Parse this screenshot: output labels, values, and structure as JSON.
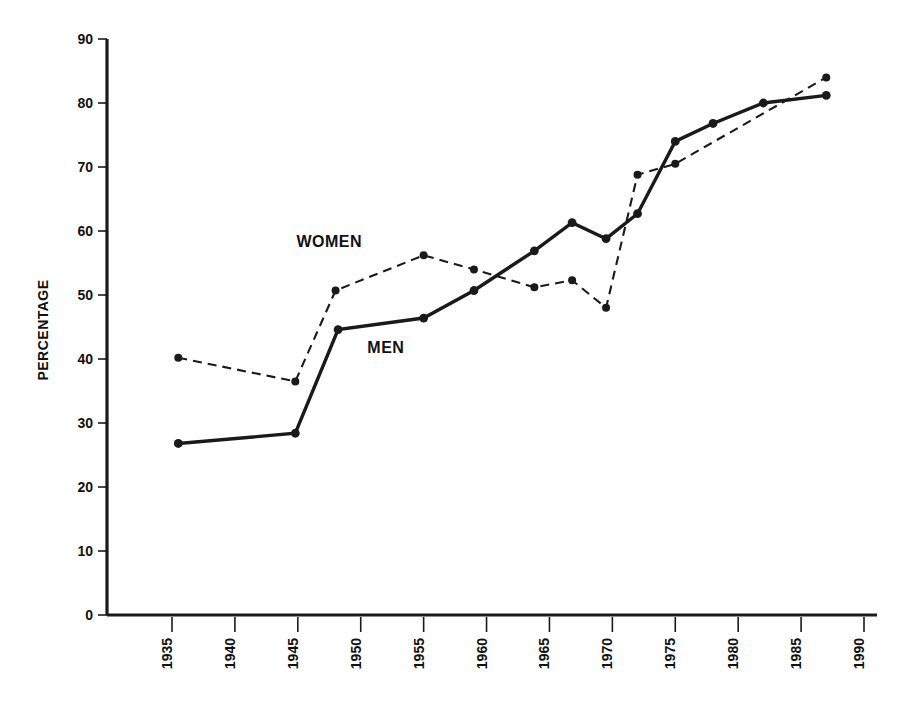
{
  "chart_data": {
    "type": "line",
    "title": "",
    "xlabel": "",
    "ylabel": "PERCENTAGE",
    "xlim": [
      1932,
      1990
    ],
    "ylim": [
      0,
      90
    ],
    "grid": false,
    "legend_position": "inline-annotations",
    "x_ticks": [
      "1935",
      "1940",
      "1945",
      "1950",
      "1955",
      "1960",
      "1965",
      "1970",
      "1975",
      "1980",
      "1985",
      "1990"
    ],
    "x_tick_values": [
      1935,
      1940,
      1945,
      1950,
      1955,
      1960,
      1965,
      1970,
      1975,
      1980,
      1985,
      1990
    ],
    "y_ticks": [
      "0",
      "10",
      "20",
      "30",
      "40",
      "50",
      "60",
      "70",
      "80",
      "90"
    ],
    "y_tick_values": [
      0,
      10,
      20,
      30,
      40,
      50,
      60,
      70,
      80,
      90
    ],
    "series": [
      {
        "name": "WOMEN",
        "style": "dashed",
        "x": [
          1935.5,
          1944.8,
          1948.0,
          1955.0,
          1959.0,
          1963.8,
          1966.8,
          1969.5,
          1972.0,
          1975.0,
          1987.0
        ],
        "values": [
          40.2,
          36.5,
          50.7,
          56.2,
          54.0,
          51.2,
          52.3,
          48.0,
          68.8,
          70.5,
          84.0
        ],
        "label_position": {
          "x": 1947.5,
          "y": 57.5
        }
      },
      {
        "name": "MEN",
        "style": "solid",
        "x": [
          1935.5,
          1944.8,
          1948.2,
          1955.0,
          1959.0,
          1963.8,
          1966.8,
          1969.5,
          1972.0,
          1975.0,
          1978.0,
          1982.0,
          1987.0
        ],
        "values": [
          26.8,
          28.4,
          44.6,
          46.4,
          50.7,
          56.9,
          61.3,
          58.8,
          62.7,
          74.0,
          76.8,
          80.0,
          81.2
        ],
        "label_position": {
          "x": 1952.0,
          "y": 41.0
        }
      }
    ]
  },
  "colors": {
    "ink": "#1a1a1a",
    "background": "#ffffff"
  },
  "labels": {
    "y_axis_title": "PERCENTAGE",
    "women_series": "WOMEN",
    "men_series": "MEN"
  }
}
